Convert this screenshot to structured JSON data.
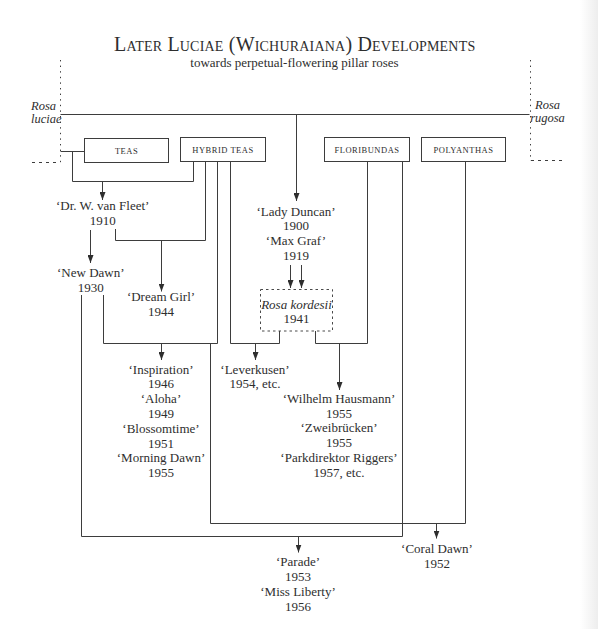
{
  "title": "Later Luciae (Wichuraiana) Developments",
  "subtitle": "towards perpetual-flowering pillar roses",
  "species": {
    "left": {
      "genus": "Rosa",
      "epithet": "luciae"
    },
    "right": {
      "genus": "Rosa",
      "epithet": "rugosa"
    }
  },
  "groups": {
    "teas": "TEAS",
    "hybrid_teas": "HYBRID TEAS",
    "floribundas": "FLORIBUNDAS",
    "polyanthas": "POLYANTHAS"
  },
  "nodes": {
    "dr_van_fleet": [
      {
        "name": "‘Dr. W. van Fleet’",
        "year": "1910"
      }
    ],
    "new_dawn": [
      {
        "name": "‘New Dawn’",
        "year": "1930"
      }
    ],
    "dream_girl": [
      {
        "name": "‘Dream Girl’",
        "year": "1944"
      }
    ],
    "lady_duncan_max_graf": [
      {
        "name": "‘Lady Duncan’",
        "year": "1900"
      },
      {
        "name": "‘Max Graf’",
        "year": "1919"
      }
    ],
    "kordesii": [
      {
        "name": "Rosa kordesii",
        "year": "1941"
      }
    ],
    "inspiration_group": [
      {
        "name": "‘Inspiration’",
        "year": "1946"
      },
      {
        "name": "‘Aloha’",
        "year": "1949"
      },
      {
        "name": "‘Blossomtime’",
        "year": "1951"
      },
      {
        "name": "‘Morning Dawn’",
        "year": "1955"
      }
    ],
    "leverkusen": [
      {
        "name": "‘Leverkusen’",
        "year": "1954, etc."
      }
    ],
    "wilhelm_group": [
      {
        "name": "‘Wilhelm Hausmann’",
        "year": "1955"
      },
      {
        "name": "‘Zweibrücken’",
        "year": "1955"
      },
      {
        "name": "‘Parkdirektor Riggers’",
        "year": "1957, etc."
      }
    ],
    "parade_group": [
      {
        "name": "‘Parade’",
        "year": "1953"
      },
      {
        "name": "‘Miss Liberty’",
        "year": "1956"
      }
    ],
    "coral_dawn": [
      {
        "name": "‘Coral Dawn’",
        "year": "1952"
      }
    ]
  },
  "edges": [
    {
      "from": [
        "Rosa luciae",
        "Rosa rugosa"
      ],
      "to": [
        "Lady Duncan",
        "Max Graf"
      ]
    },
    {
      "from": [
        "Rosa luciae",
        "Teas",
        "Hybrid Teas"
      ],
      "to": [
        "Dr. W. van Fleet"
      ]
    },
    {
      "from": [
        "Dr. W. van Fleet"
      ],
      "to": [
        "New Dawn"
      ]
    },
    {
      "from": [
        "Dr. W. van Fleet",
        "Hybrid Teas"
      ],
      "to": [
        "Dream Girl"
      ]
    },
    {
      "from": [
        "New Dawn",
        "Hybrid Teas"
      ],
      "to": [
        "Inspiration",
        "Aloha",
        "Blossomtime",
        "Morning Dawn"
      ]
    },
    {
      "from": [
        "Lady Duncan",
        "Max Graf"
      ],
      "to": [
        "Rosa kordesii"
      ]
    },
    {
      "from": [
        "Rosa kordesii",
        "Hybrid Teas"
      ],
      "to": [
        "Leverkusen"
      ]
    },
    {
      "from": [
        "Rosa kordesii",
        "Floribundas"
      ],
      "to": [
        "Wilhelm Hausmann",
        "Zweibrücken",
        "Parkdirektor Riggers"
      ]
    },
    {
      "from": [
        "New Dawn",
        "Floribundas"
      ],
      "to": [
        "Parade",
        "Miss Liberty"
      ]
    },
    {
      "from": [
        "New Dawn",
        "Hybrid Teas",
        "Polyanthas"
      ],
      "to": [
        "Coral Dawn"
      ]
    }
  ],
  "colors": {
    "ink": "#2e2e2e",
    "line": "#3d3d3d",
    "background": "#ffffff"
  }
}
